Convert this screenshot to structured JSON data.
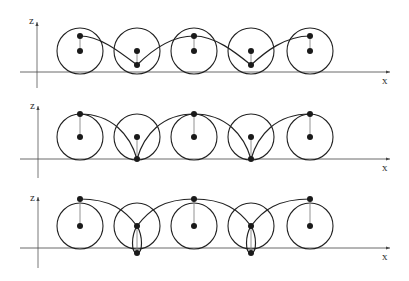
{
  "diagram": {
    "axis_labels": {
      "vertical": "z",
      "horizontal": "x"
    },
    "wheel_centers_x": [
      80,
      137,
      194,
      251,
      310
    ],
    "wheel_radius": 23,
    "panels": [
      {
        "id": "curtate",
        "label_z": "z",
        "label_x": "x",
        "ground_y": 73,
        "center_y": 51,
        "point_offset": 15,
        "curve_type": "curtate trochoid (point inside wheel)"
      },
      {
        "id": "cycloid",
        "label_z": "z",
        "label_x": "x",
        "ground_y": 159,
        "center_y": 137,
        "point_offset": 23,
        "curve_type": "cycloid (point on rim, cusps at ground)"
      },
      {
        "id": "prolate",
        "label_z": "z",
        "label_x": "x",
        "ground_y": 248,
        "center_y": 226,
        "point_offset": 27,
        "curve_type": "prolate trochoid (point outside wheel, loops)"
      }
    ]
  }
}
